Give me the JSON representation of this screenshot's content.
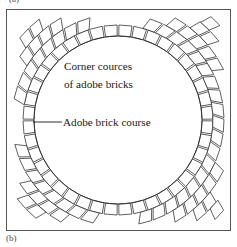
{
  "figure": {
    "caption_top": "(a)",
    "caption_bottom": "(b)",
    "frame": {
      "x": 6,
      "y": 9,
      "width": 225,
      "height": 222,
      "color": "#555555"
    }
  },
  "labels": {
    "corner_courses_line1": "Corner cources",
    "corner_courses_line2": "of adobe bricks",
    "adobe_brick_course": "Adobe brick course"
  },
  "diagram_data": {
    "type": "technical-drawing",
    "subject": "Circular adobe brick wall plan with corner courses",
    "inner_circle": {
      "cx": 118,
      "cy": 120,
      "radius": 84
    },
    "brick_ring_count": 8,
    "inner_ring_brick_count": 40,
    "brick_radial_thickness": 11,
    "stroke_color": "#2b2b2b",
    "fill_color": "#ffffff",
    "leader_line": {
      "x1": 33,
      "y1": 122,
      "x2": 62,
      "y2": 122
    }
  }
}
